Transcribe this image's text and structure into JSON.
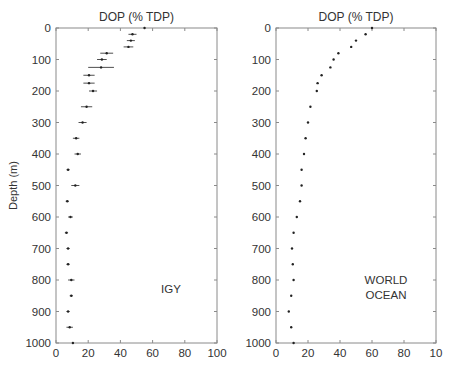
{
  "chart_data": [
    {
      "type": "scatter",
      "title": "DOP (% TDP)",
      "xlabel": "",
      "ylabel": "Depth (m)",
      "xlim": [
        0,
        100
      ],
      "ylim": [
        1000,
        0
      ],
      "x_ticks": [
        "0",
        "20",
        "40",
        "60",
        "80",
        "100"
      ],
      "y_ticks": [
        "0",
        "100",
        "200",
        "300",
        "400",
        "500",
        "600",
        "700",
        "800",
        "900",
        "1000"
      ],
      "annotation": "IGY",
      "grid": false,
      "error_bars": "horizontal",
      "series": [
        {
          "name": "IGY",
          "points": [
            {
              "depth": 0,
              "value": 55,
              "err": 0
            },
            {
              "depth": 20,
              "value": 47.5,
              "err": 2.5
            },
            {
              "depth": 40,
              "value": 46.5,
              "err": 2.5
            },
            {
              "depth": 60,
              "value": 45,
              "err": 3
            },
            {
              "depth": 80,
              "value": 31.5,
              "err": 4
            },
            {
              "depth": 100,
              "value": 28.5,
              "err": 3
            },
            {
              "depth": 125,
              "value": 28,
              "err": 8
            },
            {
              "depth": 150,
              "value": 20.5,
              "err": 3.5
            },
            {
              "depth": 175,
              "value": 20.5,
              "err": 3.5
            },
            {
              "depth": 200,
              "value": 23,
              "err": 2.5
            },
            {
              "depth": 250,
              "value": 19,
              "err": 3.5
            },
            {
              "depth": 300,
              "value": 16.5,
              "err": 2.5
            },
            {
              "depth": 350,
              "value": 12.5,
              "err": 2
            },
            {
              "depth": 400,
              "value": 13.5,
              "err": 2
            },
            {
              "depth": 450,
              "value": 7.5,
              "err": 1
            },
            {
              "depth": 500,
              "value": 12,
              "err": 2.5
            },
            {
              "depth": 550,
              "value": 7,
              "err": 1
            },
            {
              "depth": 600,
              "value": 9,
              "err": 1.5
            },
            {
              "depth": 650,
              "value": 6.5,
              "err": 1
            },
            {
              "depth": 700,
              "value": 7.5,
              "err": 1
            },
            {
              "depth": 750,
              "value": 7.5,
              "err": 1
            },
            {
              "depth": 800,
              "value": 9.5,
              "err": 2
            },
            {
              "depth": 850,
              "value": 9.5,
              "err": 1
            },
            {
              "depth": 900,
              "value": 7.5,
              "err": 1
            },
            {
              "depth": 950,
              "value": 8.5,
              "err": 2
            },
            {
              "depth": 1000,
              "value": 10.5,
              "err": 0
            }
          ]
        }
      ]
    },
    {
      "type": "scatter",
      "title": "DOP (% TDP)",
      "xlabel": "",
      "ylabel": "",
      "xlim": [
        0,
        100
      ],
      "ylim": [
        1000,
        0
      ],
      "x_ticks": [
        "0",
        "20",
        "40",
        "60",
        "80",
        "10"
      ],
      "y_ticks": [
        "0",
        "100",
        "200",
        "300",
        "400",
        "500",
        "600",
        "700",
        "800",
        "900",
        "1000"
      ],
      "annotation": "WORLD OCEAN",
      "grid": false,
      "series": [
        {
          "name": "WORLD OCEAN",
          "points": [
            {
              "depth": 0,
              "value": 60
            },
            {
              "depth": 20,
              "value": 56
            },
            {
              "depth": 40,
              "value": 50
            },
            {
              "depth": 60,
              "value": 47
            },
            {
              "depth": 80,
              "value": 39
            },
            {
              "depth": 100,
              "value": 36
            },
            {
              "depth": 125,
              "value": 34
            },
            {
              "depth": 150,
              "value": 28.5
            },
            {
              "depth": 175,
              "value": 26
            },
            {
              "depth": 200,
              "value": 25.5
            },
            {
              "depth": 250,
              "value": 21.5
            },
            {
              "depth": 300,
              "value": 20
            },
            {
              "depth": 350,
              "value": 18.5
            },
            {
              "depth": 400,
              "value": 17.5
            },
            {
              "depth": 450,
              "value": 16
            },
            {
              "depth": 500,
              "value": 16
            },
            {
              "depth": 550,
              "value": 15
            },
            {
              "depth": 600,
              "value": 13
            },
            {
              "depth": 650,
              "value": 11
            },
            {
              "depth": 700,
              "value": 10
            },
            {
              "depth": 750,
              "value": 10.5
            },
            {
              "depth": 800,
              "value": 11
            },
            {
              "depth": 850,
              "value": 9.5
            },
            {
              "depth": 900,
              "value": 8
            },
            {
              "depth": 950,
              "value": 9.5
            },
            {
              "depth": 1000,
              "value": 11
            }
          ]
        }
      ]
    }
  ],
  "panels": {
    "left": {
      "title": "DOP (% TDP)",
      "ylabel": "Depth (m)",
      "annotation": "IGY"
    },
    "right": {
      "title": "DOP (% TDP)",
      "annotation_line1": "WORLD",
      "annotation_line2": "OCEAN"
    }
  },
  "colors": {
    "axis": "#8a8a8a",
    "marker": "#222222",
    "text": "#333333"
  }
}
